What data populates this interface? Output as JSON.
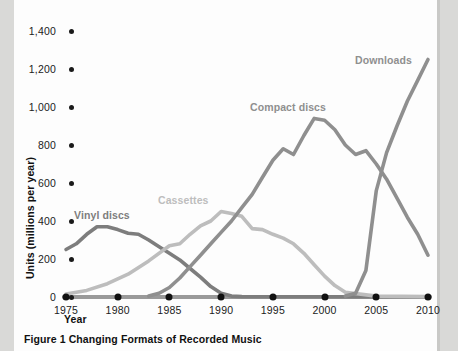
{
  "figure": {
    "caption": "Figure 1  Changing Formats of Recorded Music",
    "xaxis_title": "Year",
    "yaxis_title": "Units (millions per year)"
  },
  "series_labels": {
    "vinyl": "Vinyl discs",
    "cassettes": "Cassettes",
    "compact_discs": "Compact discs",
    "downloads": "Downloads"
  },
  "colors": {
    "vinyl": "#7d7d7d",
    "cassettes": "#bdbdbd",
    "compact_discs": "#8f8f8f",
    "downloads": "#8f8f8f",
    "axis": "#9a9a9a",
    "text": "#111111",
    "page": "#fdfdfd",
    "backdrop": "#d9d9d7"
  },
  "chart_data": {
    "type": "line",
    "title": "Changing Formats of Recorded Music",
    "xlabel": "Year",
    "ylabel": "Units (millions per year)",
    "xlim": [
      1975,
      2010
    ],
    "ylim": [
      0,
      1400
    ],
    "xticks": [
      1975,
      1980,
      1985,
      1990,
      1995,
      2000,
      2005,
      2010
    ],
    "yticks": [
      0,
      200,
      400,
      600,
      800,
      1000,
      1200,
      1400
    ],
    "ytick_labels": [
      "0",
      "200",
      "400",
      "600",
      "800",
      "1,000",
      "1,200",
      "1,400"
    ],
    "grid": false,
    "legend": "inline-labels",
    "series": [
      {
        "name": "Vinyl discs",
        "color": "#7d7d7d",
        "x": [
          1975,
          1976,
          1977,
          1978,
          1979,
          1980,
          1981,
          1982,
          1983,
          1984,
          1985,
          1986,
          1987,
          1988,
          1989,
          1990,
          1991,
          1992,
          1995,
          2000,
          2005,
          2010
        ],
        "values": [
          250,
          280,
          330,
          370,
          370,
          355,
          335,
          330,
          300,
          265,
          230,
          195,
          150,
          105,
          55,
          20,
          5,
          2,
          1,
          1,
          1,
          1
        ]
      },
      {
        "name": "Cassettes",
        "color": "#bdbdbd",
        "x": [
          1975,
          1977,
          1979,
          1981,
          1983,
          1985,
          1986,
          1987,
          1988,
          1989,
          1990,
          1991,
          1992,
          1993,
          1994,
          1995,
          1996,
          1997,
          1998,
          1999,
          2000,
          2001,
          2002,
          2005,
          2010
        ],
        "values": [
          15,
          35,
          70,
          120,
          190,
          270,
          280,
          330,
          375,
          400,
          450,
          440,
          425,
          360,
          355,
          330,
          310,
          280,
          230,
          170,
          110,
          60,
          25,
          5,
          2
        ]
      },
      {
        "name": "Compact discs",
        "color": "#8f8f8f",
        "x": [
          1983,
          1984,
          1985,
          1986,
          1987,
          1988,
          1989,
          1990,
          1991,
          1992,
          1993,
          1994,
          1995,
          1996,
          1997,
          1998,
          1999,
          2000,
          2001,
          2002,
          2003,
          2004,
          2005,
          2006,
          2007,
          2008,
          2009,
          2010
        ],
        "values": [
          5,
          20,
          50,
          100,
          160,
          220,
          280,
          340,
          400,
          470,
          540,
          630,
          720,
          780,
          750,
          850,
          940,
          930,
          880,
          800,
          750,
          770,
          700,
          620,
          520,
          420,
          330,
          220
        ]
      },
      {
        "name": "Downloads",
        "color": "#8f8f8f",
        "x": [
          2002,
          2003,
          2004,
          2005,
          2006,
          2007,
          2008,
          2009,
          2010
        ],
        "values": [
          5,
          20,
          140,
          560,
          760,
          900,
          1030,
          1140,
          1250
        ]
      }
    ]
  }
}
